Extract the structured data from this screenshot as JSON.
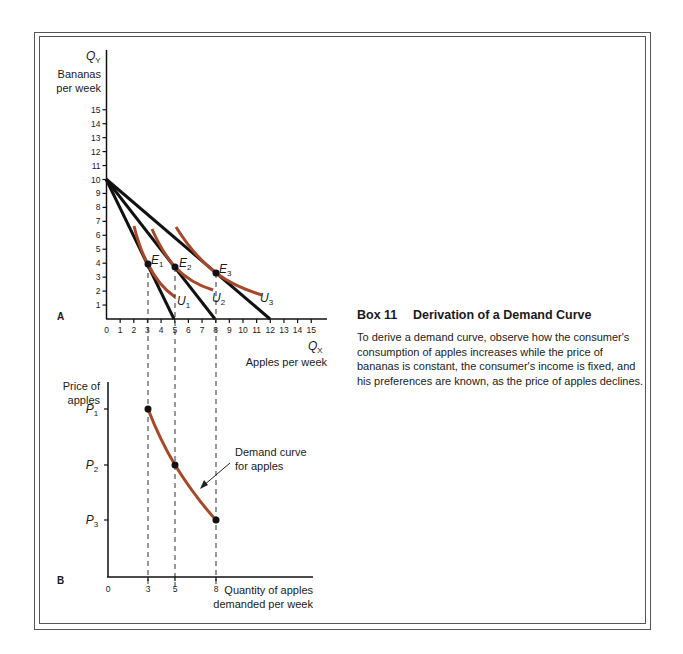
{
  "panel_a": {
    "label": "A",
    "y_axis": {
      "symbol": "Q",
      "subscript": "Y",
      "label_line1": "Bananas",
      "label_line2": "per week",
      "ticks": [
        "1",
        "2",
        "3",
        "4",
        "5",
        "6",
        "7",
        "8",
        "9",
        "10",
        "11",
        "12",
        "13",
        "14",
        "15"
      ]
    },
    "x_axis": {
      "symbol": "Q",
      "subscript": "X",
      "label": "Apples per week",
      "ticks": [
        "0",
        "1",
        "2",
        "3",
        "4",
        "5",
        "6",
        "7",
        "8",
        "9",
        "10",
        "11",
        "12",
        "13",
        "14",
        "15"
      ]
    },
    "points": [
      {
        "name": "E",
        "sub": "1"
      },
      {
        "name": "E",
        "sub": "2"
      },
      {
        "name": "E",
        "sub": "3"
      }
    ],
    "curves": [
      {
        "name": "U",
        "sub": "1"
      },
      {
        "name": "U",
        "sub": "2"
      },
      {
        "name": "U",
        "sub": "3"
      }
    ]
  },
  "panel_b": {
    "label": "B",
    "y_axis": {
      "label_line1": "Price of",
      "label_line2": "apples",
      "ticks": [
        {
          "name": "P",
          "sub": "1"
        },
        {
          "name": "P",
          "sub": "2"
        },
        {
          "name": "P",
          "sub": "3"
        }
      ]
    },
    "x_axis": {
      "label_line1": "Quantity of apples",
      "label_line2": "demanded per week",
      "ticks": [
        "0",
        "3",
        "5",
        "8"
      ]
    },
    "annotation_line1": "Demand curve",
    "annotation_line2": "for apples"
  },
  "box": {
    "number": "Box 11",
    "title": "Derivation of a Demand Curve",
    "body": "To derive a demand curve, observe how the consumer's consumption of apples increases while the price of bananas is constant, the consumer's income is fixed, and his preferences are known, as the price of apples declines."
  },
  "colors": {
    "curve": "#a6492a",
    "line": "#111111",
    "frame": "#555555"
  },
  "chart_data": [
    {
      "type": "line",
      "title": "A",
      "xlabel": "Apples per week (Q_X)",
      "ylabel": "Bananas per week (Q_Y)",
      "xlim": [
        0,
        15
      ],
      "ylim": [
        0,
        15
      ],
      "grid": false,
      "series": [
        {
          "name": "Budget line 1",
          "x": [
            0,
            5
          ],
          "y": [
            10,
            0
          ]
        },
        {
          "name": "Budget line 2",
          "x": [
            0,
            8
          ],
          "y": [
            10,
            0
          ]
        },
        {
          "name": "Budget line 3",
          "x": [
            0,
            12
          ],
          "y": [
            10,
            0
          ]
        },
        {
          "name": "U1",
          "x": [
            2,
            3,
            4.2
          ],
          "y": [
            6.7,
            4,
            1.6
          ]
        },
        {
          "name": "U2",
          "x": [
            3.3,
            5,
            7.3
          ],
          "y": [
            6.4,
            3.8,
            2.0
          ]
        },
        {
          "name": "U3",
          "x": [
            5,
            8,
            11
          ],
          "y": [
            6.5,
            3.4,
            1.8
          ]
        }
      ],
      "equilibria": [
        {
          "label": "E1",
          "x": 3,
          "y": 4
        },
        {
          "label": "E2",
          "x": 5,
          "y": 3.8
        },
        {
          "label": "E3",
          "x": 8,
          "y": 3.4
        }
      ]
    },
    {
      "type": "line",
      "title": "B",
      "xlabel": "Quantity of apples demanded per week",
      "ylabel": "Price of apples",
      "categories_y": [
        "P1",
        "P2",
        "P3"
      ],
      "grid": false,
      "series": [
        {
          "name": "Demand curve for apples",
          "x": [
            3,
            5,
            8
          ],
          "y": [
            "P1",
            "P2",
            "P3"
          ]
        }
      ],
      "annotations": [
        "Demand curve for apples"
      ]
    }
  ]
}
